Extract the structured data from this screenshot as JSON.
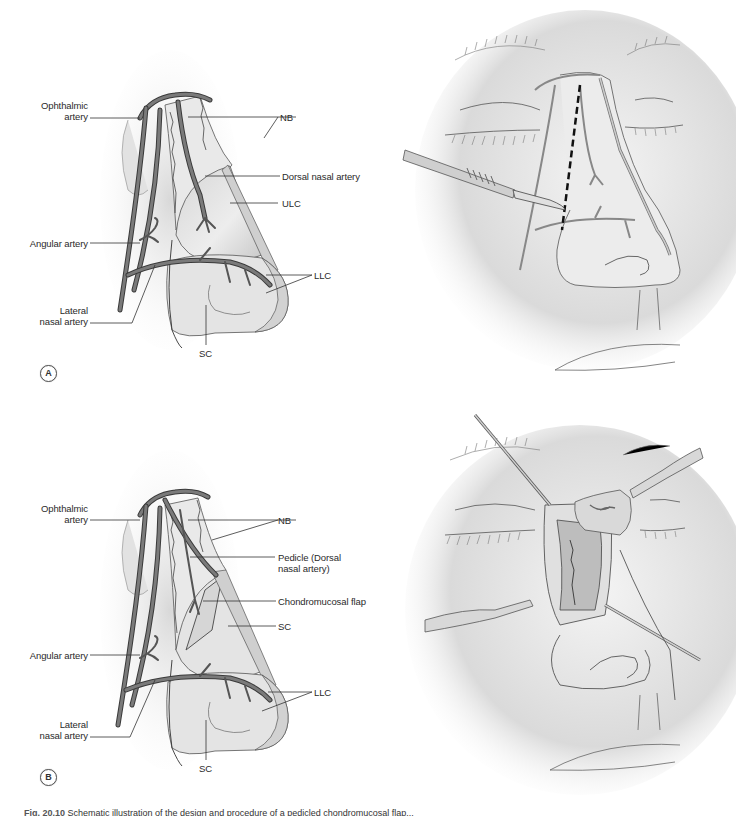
{
  "figure": {
    "caption_label": "Fig. 20.10",
    "caption_text": "Schematic illustration of the design and procedure of a pedicled chondromucosal flap...",
    "colors": {
      "artery": "#6e6e6e",
      "artery_outline": "#3a3a3a",
      "skin_shadow": "#d4d4d4",
      "cartilage": "#e6e6e6",
      "leader_line": "#333333",
      "incision_dash": "#111111"
    }
  },
  "panel_a": {
    "badge": "A",
    "labels": {
      "ophthalmic_1": "Ophthalmic",
      "ophthalmic_2": "artery",
      "nb": "NB",
      "dorsal": "Dorsal nasal artery",
      "ulc": "ULC",
      "angular": "Angular artery",
      "llc": "LLC",
      "lateral_1": "Lateral",
      "lateral_2": "nasal artery",
      "sc": "SC"
    },
    "right_illustration": "incision-with-scalpel"
  },
  "panel_b": {
    "badge": "B",
    "labels": {
      "ophthalmic_1": "Ophthalmic",
      "ophthalmic_2": "artery",
      "nb": "NB",
      "pedicle_1": "Pedicle (Dorsal",
      "pedicle_2": "nasal artery)",
      "chondro": "Chondromucosal flap",
      "sc_upper": "SC",
      "angular": "Angular artery",
      "llc": "LLC",
      "lateral_1": "Lateral",
      "lateral_2": "nasal artery",
      "sc": "SC"
    },
    "right_illustration": "flap-elevation-with-retractors"
  }
}
